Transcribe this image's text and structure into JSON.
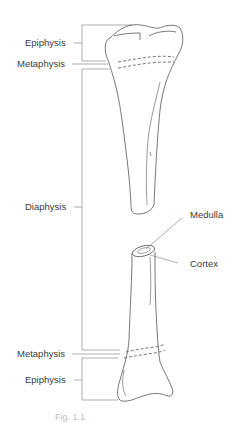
{
  "diagram": {
    "type": "anatomy-illustration",
    "labels": {
      "epiphysis_top": "Epiphysis",
      "metaphysis_top": "Metaphysis",
      "diaphysis": "Diaphysis",
      "medulla": "Medulla",
      "cortex": "Cortex",
      "metaphysis_bottom": "Metaphysis",
      "epiphysis_bottom": "Epiphysis"
    },
    "caption": "Fig. 1.1",
    "colors": {
      "line": "#555555",
      "text": "#3a3a3a",
      "background": "#ffffff"
    }
  }
}
